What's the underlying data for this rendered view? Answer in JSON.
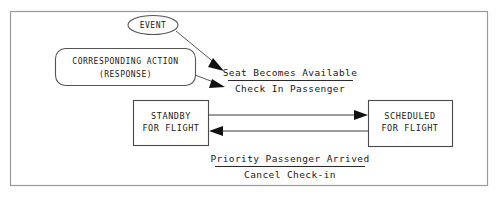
{
  "diagram": {
    "legend": {
      "event_label": "EVENT",
      "action_label_line1": "CORRESPONDING ACTION",
      "action_label_line2": "(RESPONSE)"
    },
    "states": [
      {
        "id": "standby",
        "line1": "STANDBY",
        "line2": "FOR FLIGHT"
      },
      {
        "id": "scheduled",
        "line1": "SCHEDULED",
        "line2": "FOR FLIGHT"
      }
    ],
    "transitions": [
      {
        "id": "standby-to-scheduled",
        "event": "Seat Becomes Available",
        "action": "Check In Passenger",
        "direction": "left-to-right"
      },
      {
        "id": "scheduled-to-standby",
        "event": "Priority Passenger Arrived",
        "action": "Cancel Check-in",
        "direction": "right-to-left"
      }
    ],
    "colors": {
      "frame": "#9a9a9a",
      "box_stroke": "#4a4a4a",
      "connector": "#3a3a3a",
      "text": "#1a1a1a",
      "background": "#ffffff"
    }
  }
}
